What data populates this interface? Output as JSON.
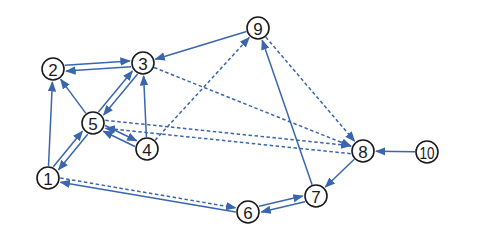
{
  "diagram": {
    "type": "directed-graph",
    "colors": {
      "edge": "#3a66ad",
      "node_stroke": "#1a1a1a",
      "node_fill": "#ffffff",
      "background": "#ffffff"
    },
    "node_radius": 11,
    "nodes": [
      {
        "id": "1",
        "label": "1",
        "x": 48,
        "y": 178
      },
      {
        "id": "2",
        "label": "2",
        "x": 53,
        "y": 69
      },
      {
        "id": "3",
        "label": "3",
        "x": 143,
        "y": 63
      },
      {
        "id": "4",
        "label": "4",
        "x": 147,
        "y": 149
      },
      {
        "id": "5",
        "label": "5",
        "x": 93,
        "y": 123
      },
      {
        "id": "6",
        "label": "6",
        "x": 248,
        "y": 212
      },
      {
        "id": "7",
        "label": "7",
        "x": 316,
        "y": 196
      },
      {
        "id": "8",
        "label": "8",
        "x": 363,
        "y": 151
      },
      {
        "id": "9",
        "label": "9",
        "x": 258,
        "y": 28
      },
      {
        "id": "10",
        "label": "10",
        "x": 427,
        "y": 152
      }
    ],
    "edges": [
      {
        "from": "2",
        "to": "3",
        "style": "solid",
        "offset": -3
      },
      {
        "from": "3",
        "to": "2",
        "style": "solid",
        "offset": -3
      },
      {
        "from": "5",
        "to": "2",
        "style": "solid",
        "offset": 0
      },
      {
        "from": "5",
        "to": "3",
        "style": "solid",
        "offset": -3
      },
      {
        "from": "3",
        "to": "5",
        "style": "solid",
        "offset": -3
      },
      {
        "from": "4",
        "to": "3",
        "style": "solid",
        "offset": 0
      },
      {
        "from": "1",
        "to": "2",
        "style": "solid",
        "offset": 0
      },
      {
        "from": "1",
        "to": "5",
        "style": "solid",
        "offset": -3
      },
      {
        "from": "5",
        "to": "1",
        "style": "solid",
        "offset": -3
      },
      {
        "from": "5",
        "to": "4",
        "style": "solid",
        "offset": -3
      },
      {
        "from": "4",
        "to": "5",
        "style": "solid",
        "offset": -3
      },
      {
        "from": "9",
        "to": "3",
        "style": "solid",
        "offset": 0
      },
      {
        "from": "7",
        "to": "9",
        "style": "solid",
        "offset": 0
      },
      {
        "from": "8",
        "to": "7",
        "style": "solid",
        "offset": 0
      },
      {
        "from": "10",
        "to": "8",
        "style": "solid",
        "offset": 0
      },
      {
        "from": "7",
        "to": "6",
        "style": "solid",
        "offset": -3
      },
      {
        "from": "6",
        "to": "7",
        "style": "solid",
        "offset": -3
      },
      {
        "from": "6",
        "to": "1",
        "style": "solid",
        "offset": -2
      },
      {
        "from": "3",
        "to": "8",
        "style": "dashed",
        "offset": 0
      },
      {
        "from": "9",
        "to": "8",
        "style": "dashed",
        "offset": 0
      },
      {
        "from": "4",
        "to": "9",
        "style": "dashed",
        "offset": 0
      },
      {
        "from": "8",
        "to": "5",
        "style": "dashed",
        "offset": -4
      },
      {
        "from": "5",
        "to": "8",
        "style": "dashed",
        "offset": -4
      },
      {
        "from": "1",
        "to": "6",
        "style": "dashed",
        "offset": -2
      }
    ]
  }
}
